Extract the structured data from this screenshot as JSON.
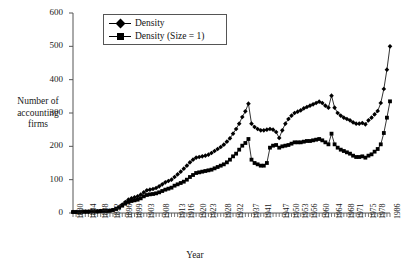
{
  "chart_data": {
    "type": "line",
    "title": "",
    "xlabel": "Year",
    "ylabel": "Number of accounting firms",
    "ylabel_lines": [
      "Number of",
      "accounting",
      "firms"
    ],
    "ylim": [
      0,
      600
    ],
    "yticks": [
      0,
      100,
      200,
      300,
      400,
      500,
      600
    ],
    "grid": false,
    "legend_position": "top-center",
    "x": [
      1880,
      1881,
      1882,
      1883,
      1884,
      1885,
      1886,
      1887,
      1888,
      1889,
      1890,
      1891,
      1892,
      1893,
      1894,
      1895,
      1896,
      1897,
      1898,
      1899,
      1900,
      1901,
      1902,
      1903,
      1904,
      1905,
      1906,
      1907,
      1908,
      1909,
      1910,
      1911,
      1912,
      1913,
      1914,
      1915,
      1916,
      1917,
      1918,
      1919,
      1920,
      1921,
      1922,
      1923,
      1924,
      1925,
      1926,
      1927,
      1928,
      1929,
      1930,
      1931,
      1932,
      1933,
      1934,
      1935,
      1936,
      1937,
      1938,
      1939,
      1940,
      1941,
      1942,
      1943,
      1944,
      1945,
      1946,
      1947,
      1948,
      1949,
      1950,
      1951,
      1952,
      1953,
      1954,
      1955,
      1956,
      1957,
      1958,
      1959,
      1960,
      1961,
      1962,
      1963,
      1964,
      1965,
      1966,
      1967,
      1968,
      1969,
      1970,
      1971,
      1972,
      1973,
      1974,
      1975,
      1976,
      1977,
      1978,
      1979,
      1980,
      1982,
      1984,
      1986
    ],
    "xticks_labeled": [
      1880,
      1884,
      1888,
      1892,
      1896,
      1899,
      1903,
      1908,
      1913,
      1916,
      1920,
      1923,
      1928,
      1932,
      1937,
      1941,
      1947,
      1950,
      1953,
      1956,
      1960,
      1964,
      1968,
      1971,
      1975,
      1978,
      1986
    ],
    "series": [
      {
        "name": "Density",
        "marker": "diamond",
        "values": [
          3,
          3,
          3,
          4,
          4,
          4,
          5,
          5,
          5,
          6,
          6,
          6,
          7,
          9,
          13,
          18,
          25,
          33,
          40,
          44,
          47,
          50,
          55,
          62,
          68,
          70,
          72,
          75,
          80,
          86,
          92,
          96,
          100,
          108,
          116,
          124,
          133,
          142,
          152,
          160,
          166,
          168,
          170,
          172,
          175,
          180,
          186,
          192,
          198,
          205,
          214,
          224,
          238,
          252,
          268,
          288,
          305,
          328,
          268,
          258,
          252,
          248,
          248,
          250,
          252,
          250,
          243,
          225,
          248,
          268,
          282,
          292,
          300,
          304,
          308,
          314,
          318,
          322,
          326,
          330,
          334,
          330,
          322,
          316,
          352,
          316,
          300,
          292,
          286,
          282,
          278,
          272,
          268,
          268,
          270,
          266,
          278,
          286,
          296,
          306,
          330,
          372,
          430,
          500
        ]
      },
      {
        "name": "Density (Size = 1)",
        "marker": "square",
        "values": [
          3,
          3,
          3,
          4,
          4,
          4,
          5,
          5,
          5,
          6,
          6,
          6,
          7,
          9,
          12,
          16,
          22,
          28,
          33,
          36,
          38,
          40,
          44,
          50,
          54,
          56,
          57,
          59,
          62,
          66,
          70,
          73,
          76,
          82,
          86,
          90,
          94,
          100,
          108,
          114,
          120,
          122,
          124,
          126,
          128,
          130,
          134,
          138,
          142,
          146,
          152,
          160,
          170,
          178,
          190,
          202,
          210,
          222,
          160,
          150,
          146,
          142,
          142,
          150,
          196,
          202,
          204,
          196,
          200,
          202,
          204,
          208,
          212,
          212,
          212,
          214,
          216,
          216,
          218,
          220,
          222,
          218,
          212,
          206,
          238,
          206,
          196,
          190,
          186,
          182,
          178,
          172,
          168,
          168,
          170,
          166,
          172,
          176,
          184,
          192,
          206,
          240,
          286,
          335
        ]
      }
    ]
  },
  "legend": {
    "items": [
      {
        "label": "Density",
        "marker": "diamond"
      },
      {
        "label": "Density (Size = 1)",
        "marker": "square"
      }
    ]
  },
  "colors": {
    "series": "#000000",
    "axis": "#555555",
    "text": "#1a1a1a",
    "background": "#ffffff"
  }
}
